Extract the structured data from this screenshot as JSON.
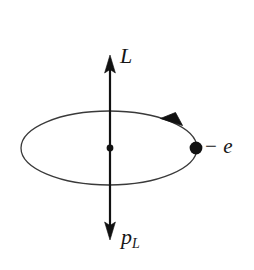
{
  "figure": {
    "kind": "physics-diagram",
    "caption_absent": true,
    "background_color": "#ffffff",
    "ink_color": "#161616",
    "orbit_stroke_color": "#3a3a3a",
    "labels": {
      "angular_momentum": "L",
      "magnetic_moment_symbol": "p",
      "magnetic_moment_subscript": "L",
      "charge_sign": "−",
      "charge_symbol": "e"
    },
    "elements": {
      "orbit_name": "electron-orbit-ellipse",
      "axis_name": "vertical-axis-arrow",
      "up_arrow_name": "angular-momentum-arrow",
      "down_arrow_name": "magnetic-moment-arrow",
      "nucleus_name": "nucleus-dot",
      "electron_name": "electron-dot",
      "direction_marker_name": "orbit-direction-arrowhead"
    },
    "geometry": {
      "ellipse_cx": 109,
      "ellipse_cy": 148,
      "ellipse_rx": 88,
      "ellipse_ry": 37,
      "axis_x": 110,
      "axis_top_y": 57,
      "axis_bottom_y": 238,
      "nucleus_r": 3.4,
      "electron_cx": 196,
      "electron_cy": 148,
      "electron_r": 6.4
    }
  }
}
